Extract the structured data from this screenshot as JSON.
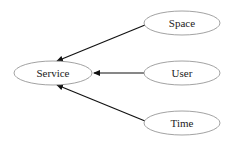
{
  "diagram": {
    "type": "directed-graph",
    "nodes": [
      {
        "id": "service",
        "label": "Service"
      },
      {
        "id": "space",
        "label": "Space"
      },
      {
        "id": "user",
        "label": "User"
      },
      {
        "id": "time",
        "label": "Time"
      }
    ],
    "edges": [
      {
        "from": "space",
        "to": "service"
      },
      {
        "from": "user",
        "to": "service"
      },
      {
        "from": "time",
        "to": "service"
      }
    ],
    "colors": {
      "node_stroke": "#8a8a8a",
      "edge": "#111111",
      "background": "#ffffff"
    }
  }
}
